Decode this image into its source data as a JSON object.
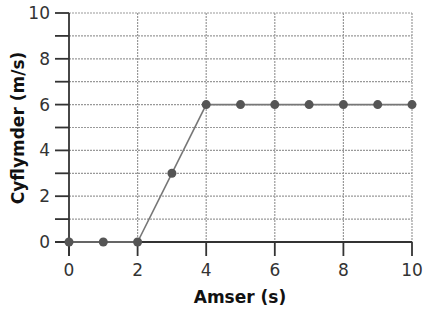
{
  "chart_data": {
    "type": "line",
    "title": "",
    "xlabel": "Amser (s)",
    "ylabel": "Cyflymder (m/s)",
    "xlim": [
      0,
      10
    ],
    "ylim": [
      0,
      10
    ],
    "x_ticks": [
      0,
      2,
      4,
      6,
      8,
      10
    ],
    "y_ticks": [
      0,
      2,
      4,
      6,
      8,
      10
    ],
    "y_minor_ticks": [
      1,
      3,
      5,
      7,
      9
    ],
    "grid": true,
    "legend": null,
    "series": [
      {
        "name": "velocity",
        "x": [
          0,
          1,
          2,
          3,
          4,
          5,
          6,
          7,
          8,
          9,
          10
        ],
        "values": [
          0,
          0,
          0,
          3,
          6,
          6,
          6,
          6,
          6,
          6,
          6
        ],
        "markers": true
      }
    ],
    "colors": {
      "line": "#777777",
      "marker": "#555555",
      "axis": "#333333",
      "grid": "#999999"
    }
  }
}
